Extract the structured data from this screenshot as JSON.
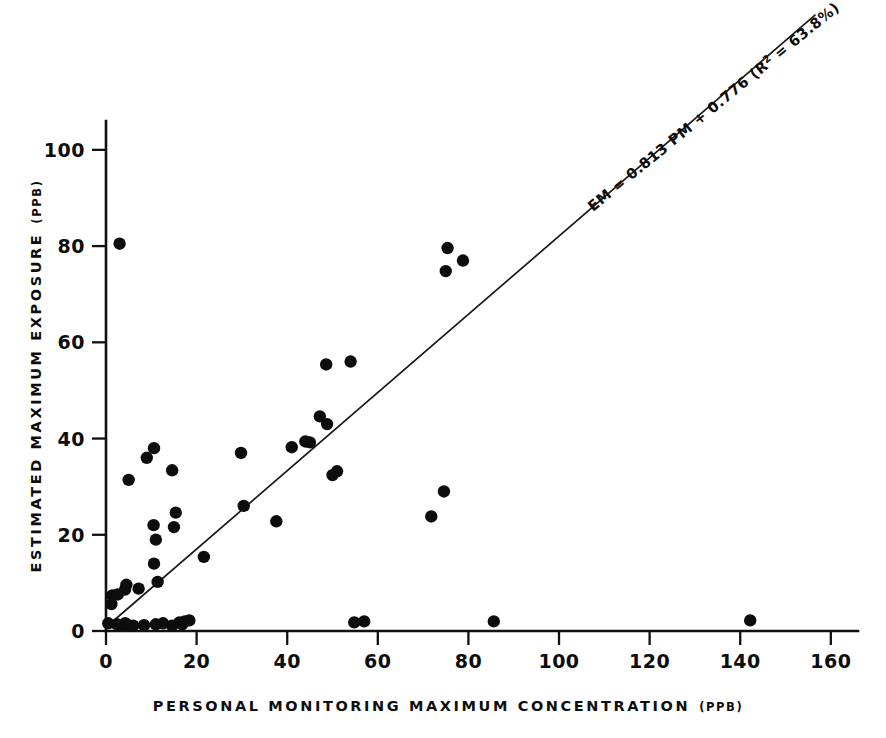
{
  "chart_data": {
    "type": "scatter",
    "title": "",
    "subtitle": "",
    "xlabel": "PERSONAL MONITORING MAXIMUM CONCENTRATION",
    "xlabel_unit": "(PPB)",
    "ylabel": "ESTIMATED MAXIMUM EXPOSURE",
    "ylabel_unit": "(PPB)",
    "xlim": [
      0,
      166
    ],
    "ylim": [
      0,
      106
    ],
    "xticks": [
      0,
      20,
      40,
      60,
      80,
      100,
      120,
      140,
      160
    ],
    "yticks": [
      0,
      20,
      40,
      60,
      80,
      100
    ],
    "xtick_labels": [
      "0",
      "20",
      "40",
      "60",
      "80",
      "100",
      "120",
      "140",
      "160"
    ],
    "ytick_labels": [
      "0",
      "20",
      "40",
      "60",
      "80",
      "100"
    ],
    "grid": false,
    "legend": null,
    "marker": "filled-circle",
    "marker_color": "#0d0d0d",
    "marker_size": 6.2,
    "points": [
      {
        "x": 0.5,
        "y": 1.6
      },
      {
        "x": 3.0,
        "y": 80.5
      },
      {
        "x": 1.2,
        "y": 5.6
      },
      {
        "x": 1.4,
        "y": 7.4
      },
      {
        "x": 2.6,
        "y": 7.6
      },
      {
        "x": 4.2,
        "y": 8.6
      },
      {
        "x": 4.5,
        "y": 9.6
      },
      {
        "x": 5.0,
        "y": 31.4
      },
      {
        "x": 7.2,
        "y": 8.8
      },
      {
        "x": 9.0,
        "y": 36.0
      },
      {
        "x": 10.6,
        "y": 38.0
      },
      {
        "x": 10.5,
        "y": 22.0
      },
      {
        "x": 10.6,
        "y": 14.0
      },
      {
        "x": 11.0,
        "y": 19.0
      },
      {
        "x": 11.4,
        "y": 10.2
      },
      {
        "x": 14.6,
        "y": 33.4
      },
      {
        "x": 15.4,
        "y": 24.6
      },
      {
        "x": 15.0,
        "y": 21.6
      },
      {
        "x": 21.6,
        "y": 15.4
      },
      {
        "x": 2.4,
        "y": 1.4
      },
      {
        "x": 3.6,
        "y": 1.2
      },
      {
        "x": 4.2,
        "y": 1.6
      },
      {
        "x": 4.6,
        "y": 1.4
      },
      {
        "x": 6.0,
        "y": 1.1
      },
      {
        "x": 8.4,
        "y": 1.2
      },
      {
        "x": 11.0,
        "y": 1.4
      },
      {
        "x": 12.6,
        "y": 1.6
      },
      {
        "x": 14.6,
        "y": 1.1
      },
      {
        "x": 16.2,
        "y": 1.8
      },
      {
        "x": 16.8,
        "y": 1.4
      },
      {
        "x": 17.4,
        "y": 2.0
      },
      {
        "x": 18.4,
        "y": 2.2
      },
      {
        "x": 29.8,
        "y": 37.0
      },
      {
        "x": 30.4,
        "y": 26.0
      },
      {
        "x": 37.6,
        "y": 22.8
      },
      {
        "x": 41.0,
        "y": 38.2
      },
      {
        "x": 44.0,
        "y": 39.4
      },
      {
        "x": 45.0,
        "y": 39.2
      },
      {
        "x": 47.2,
        "y": 44.6
      },
      {
        "x": 48.8,
        "y": 43.0
      },
      {
        "x": 48.6,
        "y": 55.4
      },
      {
        "x": 50.0,
        "y": 32.4
      },
      {
        "x": 54.0,
        "y": 56.0
      },
      {
        "x": 54.8,
        "y": 1.8
      },
      {
        "x": 57.0,
        "y": 2.0
      },
      {
        "x": 51.0,
        "y": 33.2
      },
      {
        "x": 71.8,
        "y": 23.8
      },
      {
        "x": 74.6,
        "y": 29.0
      },
      {
        "x": 75.4,
        "y": 79.6
      },
      {
        "x": 75.0,
        "y": 74.8
      },
      {
        "x": 78.8,
        "y": 77.0
      },
      {
        "x": 85.6,
        "y": 2.0
      },
      {
        "x": 142.2,
        "y": 2.2
      }
    ],
    "fit_line": {
      "equation": "EM = 0.813 PM + 0.776",
      "slope": 0.813,
      "intercept": 0.776,
      "r_squared_label": "R",
      "r_squared_sup": "2",
      "r_squared_value": " = 63.8%",
      "annotation_prefix": "EM = 0.813 PM + 0.776 (",
      "annotation_suffix": ")",
      "x_start": 0,
      "x_end": 156.5
    }
  }
}
